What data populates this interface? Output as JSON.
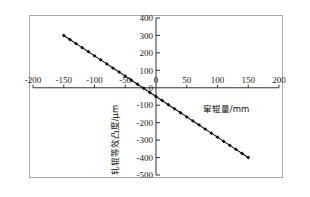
{
  "figure": {
    "background_color": "#ffffff",
    "frame_color": "#a8a8ac",
    "axis_color": "#1a1a1a",
    "series_color": "#111111"
  },
  "chart_data": {
    "type": "line",
    "title": "",
    "subtitle": "",
    "xlabel": "窜辊量/mm",
    "ylabel": "轧辊等效凸度/μm",
    "xlim": [
      -200,
      200
    ],
    "ylim": [
      -500,
      400
    ],
    "xticks": [
      -200,
      -150,
      -100,
      -50,
      0,
      50,
      100,
      150,
      200
    ],
    "xticklabels": [
      "-200",
      "-150",
      "-100",
      "-50",
      "0",
      "50",
      "100",
      "150",
      "200"
    ],
    "yticks": [
      -500,
      -400,
      -300,
      -200,
      -100,
      0,
      100,
      200,
      300,
      400
    ],
    "yticklabels": [
      "-500",
      "-400",
      "-300",
      "-200",
      "-100",
      "0",
      "100",
      "200",
      "300",
      "400"
    ],
    "grid": false,
    "legend": null,
    "legend_position": "none",
    "marker": "diamond",
    "marker_size": 3,
    "series": [
      {
        "name": "轧辊等效凸度",
        "x": [
          -150,
          -140,
          -130,
          -120,
          -110,
          -100,
          -90,
          -80,
          -70,
          -60,
          -50,
          -40,
          -30,
          -20,
          -10,
          0,
          10,
          20,
          30,
          40,
          50,
          60,
          70,
          80,
          90,
          100,
          110,
          120,
          130,
          140,
          150
        ],
        "y": [
          300,
          277,
          253,
          230,
          207,
          183,
          160,
          137,
          113,
          90,
          67,
          43,
          20,
          -3,
          -27,
          -50,
          -73,
          -97,
          -120,
          -143,
          -167,
          -190,
          -213,
          -237,
          -260,
          -283,
          -307,
          -330,
          -353,
          -377,
          -400
        ]
      }
    ]
  }
}
